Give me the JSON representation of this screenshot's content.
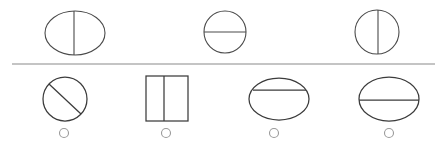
{
  "canvas": {
    "width": 443,
    "height": 146,
    "background": "#ffffff"
  },
  "colors": {
    "shape_stroke": "#4a4a4a",
    "shape_stroke_dark": "#3b3b3b",
    "divider_stroke": "#8a8a8a",
    "radio_stroke": "#9a9a9a"
  },
  "divider": {
    "name": "horizontal-rule",
    "x1": 12,
    "y1": 64,
    "x2": 435,
    "y2": 64
  },
  "prompt_row": {
    "label": "top-row-sample-shapes",
    "shapes": [
      {
        "id": "prompt-shape-1",
        "figure": "ellipse-split-vertical",
        "outline": "ellipse",
        "divider_orientation": "vertical",
        "cx": 75,
        "cy": 33,
        "rx": 30,
        "ry": 22,
        "line": {
          "x1": 74,
          "y1": 11,
          "x2": 74,
          "y2": 55
        }
      },
      {
        "id": "prompt-shape-2",
        "figure": "circle-split-horizontal",
        "outline": "circle",
        "divider_orientation": "horizontal",
        "cx": 225,
        "cy": 32,
        "rx": 21,
        "ry": 21,
        "line": {
          "x1": 204,
          "y1": 32,
          "x2": 246,
          "y2": 32
        }
      },
      {
        "id": "prompt-shape-3",
        "figure": "circle-split-vertical",
        "outline": "circle",
        "divider_orientation": "vertical",
        "cx": 377,
        "cy": 32,
        "rx": 22,
        "ry": 22,
        "line": {
          "x1": 378,
          "y1": 10,
          "x2": 378,
          "y2": 54
        }
      }
    ]
  },
  "answer_row": {
    "label": "bottom-row-answer-options",
    "options": [
      {
        "id": "option-1",
        "figure": "circle-split-diagonal",
        "outline": "circle",
        "divider_orientation": "diagonal",
        "cx": 65,
        "cy": 99,
        "rx": 22,
        "ry": 22,
        "line": {
          "x1": 49,
          "y1": 84,
          "x2": 81,
          "y2": 114
        },
        "radio": {
          "cx": 64,
          "cy": 133,
          "r": 4.5,
          "selected": false
        }
      },
      {
        "id": "option-2",
        "figure": "rectangle-split-vertical",
        "outline": "rectangle",
        "divider_orientation": "vertical",
        "x": 146,
        "y": 76,
        "width": 42,
        "height": 45,
        "line": {
          "x1": 164,
          "y1": 76,
          "x2": 164,
          "y2": 121
        },
        "radio": {
          "cx": 166,
          "cy": 133,
          "r": 4.5,
          "selected": false
        }
      },
      {
        "id": "option-3",
        "figure": "ellipse-split-horizontal-high",
        "outline": "ellipse",
        "divider_orientation": "horizontal",
        "cx": 279,
        "cy": 99,
        "rx": 30,
        "ry": 21,
        "line": {
          "x1": 253,
          "y1": 90,
          "x2": 306,
          "y2": 90
        },
        "radio": {
          "cx": 274,
          "cy": 133,
          "r": 4.5,
          "selected": false
        }
      },
      {
        "id": "option-4",
        "figure": "ellipse-split-horizontal-mid",
        "outline": "ellipse",
        "divider_orientation": "horizontal",
        "cx": 389,
        "cy": 99,
        "rx": 30,
        "ry": 22,
        "line": {
          "x1": 359,
          "y1": 100,
          "x2": 419,
          "y2": 100
        },
        "radio": {
          "cx": 389,
          "cy": 133,
          "r": 4.5,
          "selected": false
        }
      }
    ]
  }
}
